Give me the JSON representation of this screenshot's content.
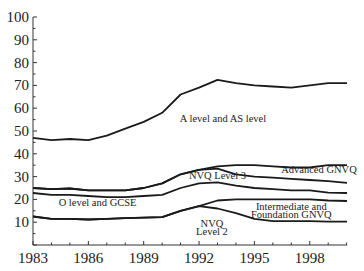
{
  "chart_data": {
    "type": "line",
    "title": "",
    "xlabel": "",
    "ylabel": "",
    "xlim": [
      1983,
      2000
    ],
    "ylim": [
      0,
      100
    ],
    "grid": false,
    "legend": "inline annotations",
    "x": [
      1983,
      1984,
      1985,
      1986,
      1987,
      1988,
      1989,
      1990,
      1991,
      1992,
      1993,
      1994,
      1995,
      1996,
      1997,
      1998,
      1999,
      2000
    ],
    "x_ticks": [
      "1983",
      "1986",
      "1989",
      "1992",
      "1995",
      "1998"
    ],
    "y_ticks": [
      "10",
      "20",
      "30",
      "40",
      "50",
      "60",
      "70",
      "80",
      "90",
      "100"
    ],
    "series": [
      {
        "name": "A level and AS level (upper boundary)",
        "values": [
          47,
          46,
          46.5,
          46,
          48,
          51,
          54,
          58,
          66,
          69,
          72.4,
          71,
          70,
          69.5,
          69,
          70,
          71,
          71
        ]
      },
      {
        "name": "Advanced GNVQ (upper boundary)",
        "values": [
          25,
          24.5,
          24.8,
          24,
          24,
          24,
          25,
          27,
          31,
          33,
          34.5,
          35,
          35,
          34.5,
          34,
          34,
          35,
          35
        ]
      },
      {
        "name": "NVQ Level 3 (upper boundary)",
        "values": [
          25,
          24.5,
          24.8,
          24,
          24,
          24,
          25,
          27,
          31,
          33,
          33.5,
          31,
          30,
          29.5,
          29,
          28.5,
          28,
          27.3
        ]
      },
      {
        "name": "O level and GCSE (upper boundary)",
        "values": [
          22.8,
          22,
          22,
          21.5,
          21,
          21,
          21.5,
          22,
          25,
          27,
          27.5,
          26,
          25,
          24.5,
          24,
          24,
          23,
          22.8
        ]
      },
      {
        "name": "Intermediate and Foundation GNVQ (upper boundary)",
        "values": [
          12.5,
          11.5,
          11.5,
          11.2,
          11.5,
          11.8,
          12,
          12.2,
          15,
          17,
          19.5,
          20,
          20,
          20,
          20,
          20,
          19.5,
          19.3
        ]
      },
      {
        "name": "NVQ Level 2 (upper boundary)",
        "values": [
          12.5,
          11.5,
          11.5,
          11.2,
          11.5,
          11.8,
          12,
          12.2,
          15,
          17,
          16,
          14,
          11.5,
          10.5,
          10.5,
          10.5,
          10.2,
          10.2
        ]
      }
    ],
    "annotations": [
      {
        "text": "A level and AS level",
        "x": 1993.3,
        "y": 54
      },
      {
        "text": "Advanced GNVQ",
        "x": 1998.5,
        "y": 31.5
      },
      {
        "text": "NVQ Level 3",
        "x": 1993,
        "y": 29
      },
      {
        "text": "O level and GCSE",
        "x": 1986.5,
        "y": 17
      },
      {
        "text": "Intermediate and",
        "x": 1997,
        "y": 15.5
      },
      {
        "text": "Foundation GNVQ",
        "x": 1997,
        "y": 12
      },
      {
        "text": "NVQ",
        "x": 1992.7,
        "y": 8
      },
      {
        "text": "Level 2",
        "x": 1992.7,
        "y": 4.5
      }
    ]
  }
}
